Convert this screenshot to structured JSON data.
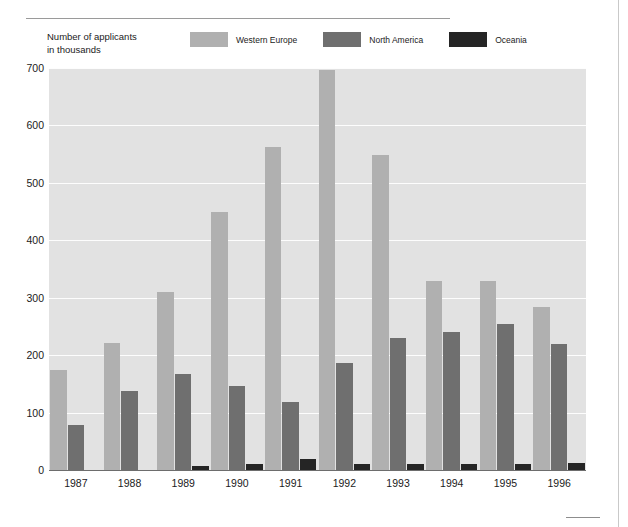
{
  "figure": {
    "axis_caption_line1": "Number of applicants",
    "axis_caption_line2": "in thousands"
  },
  "legend": {
    "items": [
      {
        "label": "Western Europe",
        "color": "#b0b0b0",
        "icon": "legend-swatch-icon"
      },
      {
        "label": "North America",
        "color": "#6f6f6f",
        "icon": "legend-swatch-icon"
      },
      {
        "label": "Oceania",
        "color": "#252525",
        "icon": "legend-swatch-icon"
      }
    ]
  },
  "chart_data": {
    "type": "bar",
    "title": "",
    "subtitle": "",
    "xlabel": "",
    "ylabel": "Number of applicants in thousands",
    "ylim": [
      0,
      700
    ],
    "yticks": [
      0,
      100,
      200,
      300,
      400,
      500,
      600,
      700
    ],
    "ytick_labels": [
      "0",
      "100",
      "200",
      "300",
      "400",
      "500",
      "600",
      "700"
    ],
    "grid": true,
    "grid_axis": "y",
    "legend_position": "top",
    "plot_background": "#e2e2e2",
    "categories": [
      "1987",
      "1988",
      "1989",
      "1990",
      "1991",
      "1992",
      "1993",
      "1994",
      "1995",
      "1996"
    ],
    "series": [
      {
        "name": "Western Europe",
        "color": "#b0b0b0",
        "values": [
          174,
          222,
          310,
          449,
          563,
          696,
          549,
          330,
          330,
          283
        ]
      },
      {
        "name": "North America",
        "color": "#6f6f6f",
        "values": [
          79,
          138,
          168,
          146,
          119,
          186,
          230,
          241,
          255,
          220
        ]
      },
      {
        "name": "Oceania",
        "color": "#252525",
        "values": [
          0,
          0,
          7,
          10,
          19,
          11,
          10,
          11,
          11,
          13
        ]
      }
    ]
  }
}
